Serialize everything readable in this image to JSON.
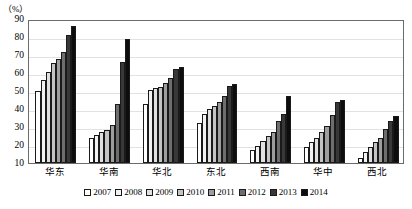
{
  "chart_data": {
    "type": "bar",
    "title": "",
    "subtitle": "",
    "xlabel": "",
    "ylabel": "(%)",
    "unit_label": "（%）",
    "ylim": [
      10,
      90
    ],
    "ytick_values": [
      10,
      20,
      30,
      40,
      50,
      60,
      70,
      80,
      90
    ],
    "ytick_labels": [
      "10",
      "20",
      "30",
      "40",
      "50",
      "60",
      "70",
      "80",
      "90"
    ],
    "grid": true,
    "legend_position": "bottom",
    "categories": [
      "华东",
      "华南",
      "华北",
      "东北",
      "西南",
      "华中",
      "西北"
    ],
    "series": [
      {
        "name": "2007",
        "color": "#ffffff",
        "values": [
          50.0,
          24.0,
          43.0,
          32.0,
          17.0,
          19.0,
          13.0
        ]
      },
      {
        "name": "2008",
        "color": "#f2f2f2",
        "values": [
          56.0,
          25.5,
          50.5,
          37.5,
          19.5,
          21.5,
          16.0
        ]
      },
      {
        "name": "2009",
        "color": "#e0e0e0",
        "values": [
          60.5,
          27.0,
          51.5,
          40.0,
          22.5,
          24.0,
          19.0
        ]
      },
      {
        "name": "2010",
        "color": "#c4c4c4",
        "values": [
          65.5,
          28.5,
          52.5,
          41.5,
          25.0,
          27.0,
          21.5
        ]
      },
      {
        "name": "2011",
        "color": "#9e9e9e",
        "values": [
          68.0,
          31.0,
          54.5,
          44.0,
          27.5,
          30.5,
          24.0
        ]
      },
      {
        "name": "2012",
        "color": "#6e6e6e",
        "values": [
          71.5,
          43.0,
          57.5,
          47.0,
          33.5,
          36.5,
          29.0
        ]
      },
      {
        "name": "2013",
        "color": "#383838",
        "values": [
          81.0,
          66.0,
          62.5,
          53.0,
          37.0,
          44.0,
          33.5
        ]
      },
      {
        "name": "2014",
        "color": "#0d0d0d",
        "values": [
          86.0,
          79.0,
          63.5,
          54.0,
          47.0,
          45.0,
          36.0
        ]
      }
    ],
    "legend_entries": [
      "2007",
      "2008",
      "2009",
      "2010",
      "2011",
      "2012",
      "2013",
      "2014"
    ]
  }
}
